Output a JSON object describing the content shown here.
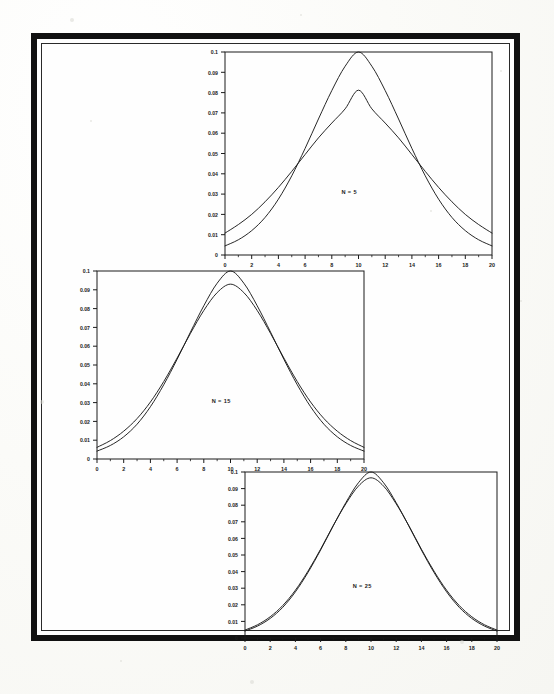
{
  "page": {
    "kind": "scanned-figure-page",
    "background_color": "#fdfdfb",
    "frame_color": "#111111"
  },
  "figure": {
    "panel_count": 3,
    "axis": {
      "x_min": 0,
      "x_max": 20,
      "x_tick_step": 2,
      "x_ticks": [
        "0",
        "2",
        "4",
        "6",
        "8",
        "10",
        "12",
        "14",
        "16",
        "18",
        "20"
      ],
      "y_min": 0,
      "y_max": 0.1,
      "y_tick_step": 0.01,
      "y_ticks": [
        "0",
        "0.01",
        "0.02",
        "0.03",
        "0.04",
        "0.05",
        "0.06",
        "0.07",
        "0.08",
        "0.09",
        "0.1"
      ]
    }
  },
  "chart_data": [
    {
      "type": "line",
      "id": "panel-top",
      "title": "",
      "annotation": "N = 5",
      "xlabel": "",
      "ylabel": "",
      "xlim": [
        0,
        20
      ],
      "ylim": [
        0,
        0.1
      ],
      "grid": false,
      "legend": "none",
      "x": [
        0,
        1,
        2,
        3,
        4,
        5,
        6,
        7,
        8,
        9,
        10,
        11,
        12,
        13,
        14,
        15,
        16,
        17,
        18,
        19,
        20
      ],
      "series": [
        {
          "name": "narrow-curve",
          "peak_x": 10,
          "peak_y": 0.1,
          "values": [
            0.0045,
            0.0075,
            0.012,
            0.0185,
            0.0275,
            0.039,
            0.0525,
            0.067,
            0.081,
            0.093,
            0.1,
            0.093,
            0.081,
            0.067,
            0.0525,
            0.039,
            0.0275,
            0.0185,
            0.012,
            0.0075,
            0.0045
          ]
        },
        {
          "name": "broad-curve",
          "peak_x": 10,
          "peak_y": 0.081,
          "values": [
            0.0108,
            0.015,
            0.02,
            0.0262,
            0.0333,
            0.0412,
            0.0495,
            0.0577,
            0.065,
            0.072,
            0.0812,
            0.072,
            0.065,
            0.0577,
            0.0495,
            0.0412,
            0.0333,
            0.0262,
            0.02,
            0.015,
            0.0108
          ]
        }
      ]
    },
    {
      "type": "line",
      "id": "panel-middle",
      "title": "",
      "annotation": "N = 15",
      "xlabel": "",
      "ylabel": "",
      "xlim": [
        0,
        20
      ],
      "ylim": [
        0,
        0.1
      ],
      "grid": false,
      "legend": "none",
      "x": [
        0,
        1,
        2,
        3,
        4,
        5,
        6,
        7,
        8,
        9,
        10,
        11,
        12,
        13,
        14,
        15,
        16,
        17,
        18,
        19,
        20
      ],
      "series": [
        {
          "name": "narrow-curve",
          "peak_x": 10,
          "peak_y": 0.1,
          "values": [
            0.0042,
            0.0072,
            0.0118,
            0.0185,
            0.0278,
            0.0395,
            0.053,
            0.0675,
            0.0815,
            0.0935,
            0.1,
            0.0935,
            0.0815,
            0.0675,
            0.053,
            0.0395,
            0.0278,
            0.0185,
            0.0118,
            0.0072,
            0.0042
          ]
        },
        {
          "name": "broad-curve",
          "peak_x": 10,
          "peak_y": 0.093,
          "values": [
            0.0062,
            0.0098,
            0.0148,
            0.0215,
            0.0303,
            0.0412,
            0.0537,
            0.0668,
            0.079,
            0.0885,
            0.093,
            0.0885,
            0.079,
            0.0668,
            0.0537,
            0.0412,
            0.0303,
            0.0215,
            0.0148,
            0.0098,
            0.0062
          ]
        }
      ]
    },
    {
      "type": "line",
      "id": "panel-bottom",
      "title": "",
      "annotation": "N = 25",
      "xlabel": "",
      "ylabel": "",
      "xlim": [
        0,
        20
      ],
      "ylim": [
        0,
        0.1
      ],
      "grid": false,
      "legend": "none",
      "x": [
        0,
        1,
        2,
        3,
        4,
        5,
        6,
        7,
        8,
        9,
        10,
        11,
        12,
        13,
        14,
        15,
        16,
        17,
        18,
        19,
        20
      ],
      "series": [
        {
          "name": "narrow-curve",
          "peak_x": 10,
          "peak_y": 0.1,
          "values": [
            0.0042,
            0.0072,
            0.0118,
            0.0185,
            0.0278,
            0.0395,
            0.053,
            0.0675,
            0.0815,
            0.0935,
            0.1,
            0.0935,
            0.0815,
            0.0675,
            0.053,
            0.0395,
            0.0278,
            0.0185,
            0.0118,
            0.0072,
            0.0042
          ]
        },
        {
          "name": "broad-curve",
          "peak_x": 10,
          "peak_y": 0.0965,
          "values": [
            0.0048,
            0.008,
            0.0128,
            0.0196,
            0.0288,
            0.0403,
            0.0535,
            0.0677,
            0.0808,
            0.0915,
            0.0965,
            0.0915,
            0.0808,
            0.0677,
            0.0535,
            0.0403,
            0.0288,
            0.0196,
            0.0128,
            0.008,
            0.0048
          ]
        }
      ]
    }
  ]
}
